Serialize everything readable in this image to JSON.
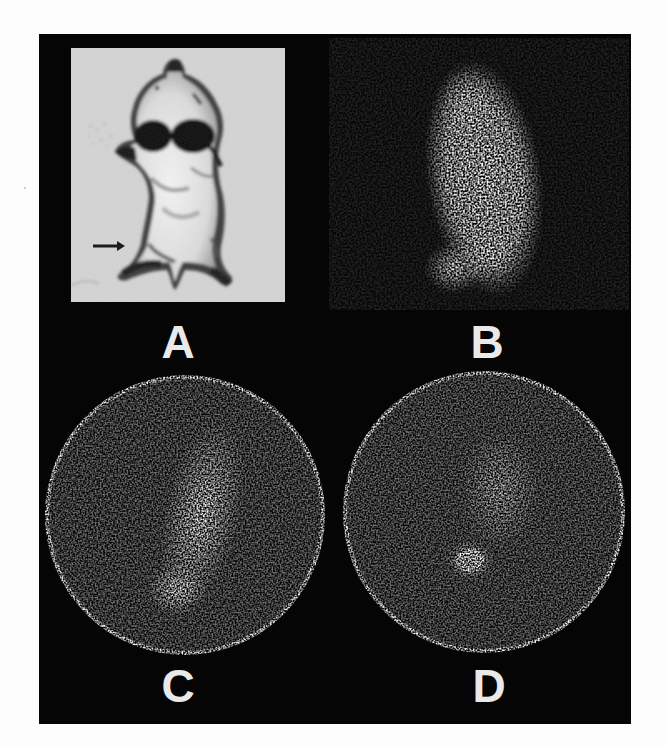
{
  "figure": {
    "background_color": "#050505",
    "page_color": "#fdfdfd",
    "label_color": "#e9e9e9",
    "panels": [
      {
        "id": "A",
        "label": "A",
        "kind": "photograph",
        "description": "Ventral view photograph of rat with arrow indicating site",
        "annotation": "arrow-right"
      },
      {
        "id": "B",
        "label": "B",
        "kind": "scintigram",
        "description": "Gamma-camera image, elongated uptake with focal hot spot lower left"
      },
      {
        "id": "C",
        "label": "C",
        "kind": "scintigram-circular",
        "description": "Circular field-of-view image, diagonal uptake with focal spot at lower center"
      },
      {
        "id": "D",
        "label": "D",
        "kind": "scintigram-circular",
        "description": "Circular field-of-view image, diffuse uptake with compact focal spot at center"
      }
    ]
  }
}
